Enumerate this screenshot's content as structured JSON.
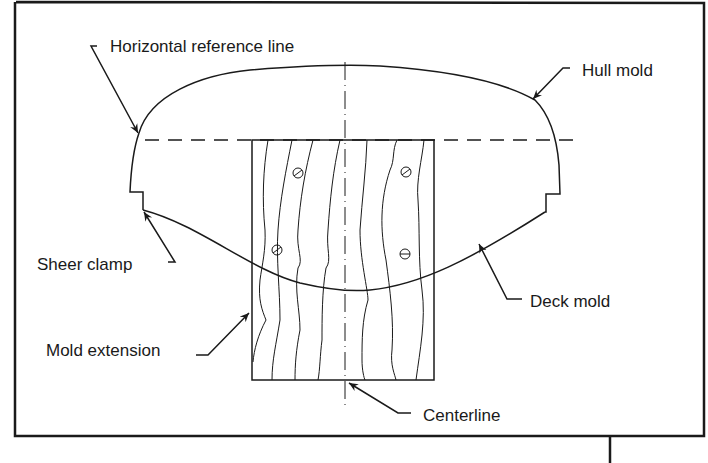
{
  "diagram": {
    "type": "technical-drawing",
    "labels": {
      "horizontal_reference_line": "Horizontal reference line",
      "hull_mold": "Hull mold",
      "sheer_clamp": "Sheer clamp",
      "deck_mold": "Deck mold",
      "mold_extension": "Mold extension",
      "centerline": "Centerline"
    },
    "colors": {
      "line": "#1a1a1a",
      "background": "#ffffff"
    }
  }
}
